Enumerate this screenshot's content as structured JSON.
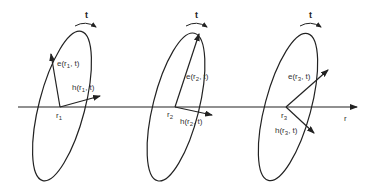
{
  "figure": {
    "axis": {
      "label": "r",
      "x1": 18,
      "y": 107,
      "x2": 357
    },
    "stroke_color": "#222222",
    "sections": [
      {
        "id": 1,
        "origin_label": "r",
        "origin_sub": "1",
        "origin": [
          60,
          107
        ],
        "ellipse": {
          "cx": 62,
          "cy": 106,
          "rx": 23,
          "ry": 77,
          "rotate": 14.5
        },
        "rotation_label": "t",
        "rotation_label_pos": [
          85,
          18
        ],
        "rotation_arc": {
          "x1": 75,
          "y1": 26,
          "x2": 96,
          "y2": 27
        },
        "e_vector": {
          "to": [
            51,
            54
          ],
          "label_main": "e(r",
          "label_sub": "1",
          "label_tail": ", t)",
          "label_pos": [
            57,
            66
          ]
        },
        "h_vector": {
          "to": [
            100,
            96
          ],
          "label_main": "h(r",
          "label_sub": "1",
          "label_tail": ", t)",
          "label_pos": [
            72,
            90
          ]
        },
        "origin_label_pos": [
          56,
          118
        ]
      },
      {
        "id": 2,
        "origin_label": "r",
        "origin_sub": "2",
        "origin": [
          175,
          107
        ],
        "ellipse": {
          "cx": 176,
          "cy": 107,
          "rx": 23,
          "ry": 76,
          "rotate": 14
        },
        "rotation_label": "t",
        "rotation_label_pos": [
          195,
          18
        ],
        "rotation_arc": {
          "x1": 186,
          "y1": 26,
          "x2": 207,
          "y2": 27
        },
        "e_vector": {
          "to": [
            199,
            34
          ],
          "label_main": "e(r",
          "label_sub": "2",
          "label_tail": ", t)",
          "label_pos": [
            186,
            79
          ]
        },
        "h_vector": {
          "to": [
            212,
            115
          ],
          "label_main": "h(r",
          "label_sub": "2",
          "label_tail": ", t)",
          "label_pos": [
            180,
            124
          ]
        },
        "origin_label_pos": [
          167,
          117
        ]
      },
      {
        "id": 3,
        "origin_label": "r",
        "origin_sub": "3",
        "origin": [
          286,
          107
        ],
        "ellipse": {
          "cx": 288,
          "cy": 107,
          "rx": 23,
          "ry": 76,
          "rotate": 15
        },
        "rotation_label": "t",
        "rotation_label_pos": [
          309,
          18
        ],
        "rotation_arc": {
          "x1": 300,
          "y1": 26,
          "x2": 321,
          "y2": 27
        },
        "e_vector": {
          "to": [
            328,
            70
          ],
          "label_main": "e(r",
          "label_sub": "3",
          "label_tail": ", t)",
          "label_pos": [
            288,
            79
          ]
        },
        "h_vector": {
          "to": [
            314,
            133
          ],
          "label_main": "h(r",
          "label_sub": "3",
          "label_tail": ", t)",
          "label_pos": [
            275,
            133
          ]
        },
        "origin_label_pos": [
          281,
          118
        ]
      }
    ],
    "axis_label_pos": [
      344,
      121
    ]
  }
}
